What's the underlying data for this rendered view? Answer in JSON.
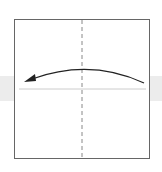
{
  "diagram": {
    "type": "origami-fold-step",
    "paper": {
      "shape": "square",
      "border_color": "#666666",
      "fill": "#ffffff"
    },
    "background_band_color": "#ececec",
    "center_crease": {
      "style": "dashed",
      "orientation": "vertical",
      "color": "#888888"
    },
    "horizontal_crease": {
      "style": "solid",
      "orientation": "horizontal",
      "color": "#cccccc"
    },
    "arrow": {
      "direction": "right-to-left",
      "shape": "arc",
      "color": "#222222"
    }
  }
}
